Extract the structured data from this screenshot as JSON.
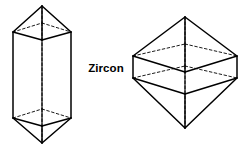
{
  "figure": {
    "name": "zircon-crystal-habits",
    "label": "Zircon",
    "background_color": "#ffffff",
    "line_color": "#000000",
    "hidden_line_style": "dashed",
    "mineral": "Zircon",
    "crystal_system": "Tetragonal",
    "forms_shown": 2
  },
  "crystals": [
    {
      "id": "left-crystal",
      "name": "elongated-prism-bipyramid",
      "description": "Elongated tetragonal prism terminated by bipyramids at both ends",
      "habit": "prismatic",
      "bounds": {
        "x": 8,
        "y": 2,
        "width": 68,
        "height": 145
      }
    },
    {
      "id": "right-crystal",
      "name": "squat-bipyramid",
      "description": "Squat tetragonal bipyramid with short prism zone",
      "habit": "dipyramidal",
      "bounds": {
        "x": 131,
        "y": 15,
        "width": 108,
        "height": 116
      }
    }
  ],
  "geometry": {
    "left": {
      "top_apex": [
        42,
        6
      ],
      "bottom_apex": [
        42,
        143
      ],
      "prism_top_front_left": [
        13,
        32
      ],
      "prism_top_front_mid": [
        42,
        40
      ],
      "prism_top_front_right": [
        71,
        32
      ],
      "prism_top_back": [
        42,
        23
      ],
      "prism_bottom_front_left": [
        13,
        118
      ],
      "prism_bottom_front_mid": [
        42,
        126
      ],
      "prism_bottom_front_right": [
        71,
        118
      ],
      "prism_bottom_back": [
        42,
        109
      ]
    },
    "right": {
      "top_apex": [
        185,
        17
      ],
      "bottom_apex": [
        185,
        128
      ],
      "girdle_left": [
        133,
        56
      ],
      "girdle_right": [
        237,
        56
      ],
      "girdle_front": [
        185,
        72
      ],
      "girdle_back": [
        185,
        44
      ],
      "prism_height": 22
    }
  }
}
